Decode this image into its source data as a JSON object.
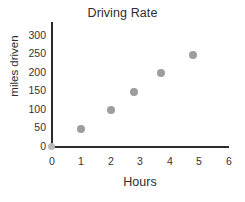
{
  "chart_data": {
    "type": "scatter",
    "title": "Driving Rate",
    "xlabel": "Hours",
    "ylabel": "miles driven",
    "xlim": [
      0,
      6.4
    ],
    "ylim": [
      0,
      320
    ],
    "xticks": [
      "0",
      "1",
      "2",
      "3",
      "4",
      "5",
      "6"
    ],
    "yticks": [
      "0",
      "50",
      "100",
      "150",
      "200",
      "250",
      "300"
    ],
    "grid": false,
    "legend": null,
    "marker_color": "#9d9d9d",
    "axis_color": "#2b2b2b",
    "points": [
      {
        "x": 1.0,
        "y": 50
      },
      {
        "x": 2.0,
        "y": 100
      },
      {
        "x": 2.8,
        "y": 150
      },
      {
        "x": 3.7,
        "y": 200
      },
      {
        "x": 4.8,
        "y": 250
      }
    ]
  }
}
